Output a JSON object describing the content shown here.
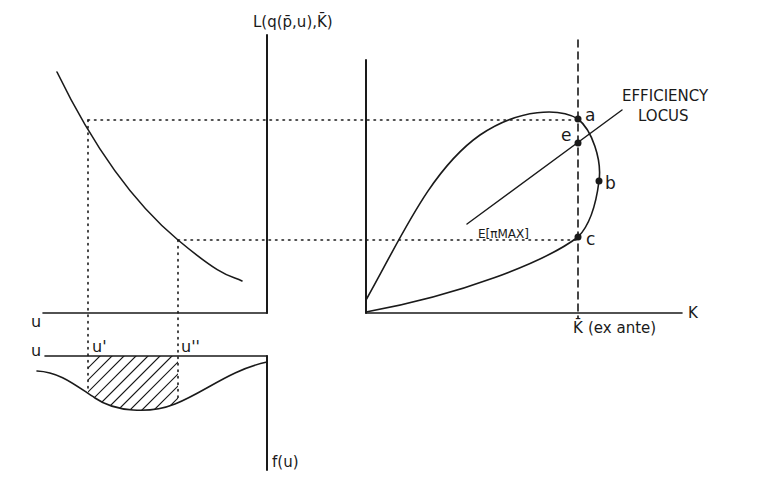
{
  "diagram": {
    "type": "four-quadrant economic diagram",
    "colors": {
      "ink": "#1a1a1a",
      "background": "#ffffff"
    },
    "labels": {
      "top_axis": "L(q(p̄,u),K̄)",
      "efficiency_locus_line1": "EFFICIENCY",
      "efficiency_locus_line2": "LOCUS",
      "expected_profit_max": "E[πMAX]",
      "point_a": "a",
      "point_e": "e",
      "point_b": "b",
      "point_c": "c",
      "k_axis": "K",
      "k_bar": "K̄",
      "k_bar_suffix": "(ex ante)",
      "u_axis_upper": "u",
      "u_axis_lower": "u",
      "u_prime": "u'",
      "u_double_prime": "u''",
      "density": "f(u)"
    },
    "panels": {
      "upper_left": "decreasing curve mapping u to labor L",
      "upper_right": "closed loop of L vs K with efficiency locus through point e",
      "lower_left": "density f(u) with shaded region between u' and u''"
    }
  }
}
